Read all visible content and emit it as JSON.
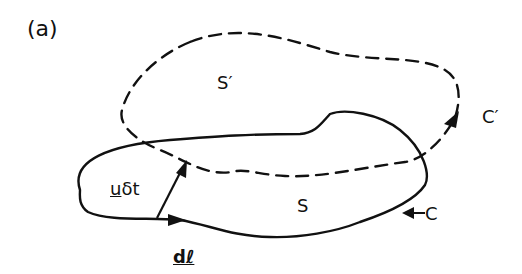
{
  "figure": {
    "panel_label": "(a)",
    "labels": {
      "surface_displaced": "S′",
      "contour_displaced": "C′",
      "surface": "S",
      "contour": "C",
      "velocity_displacement": "uδt",
      "line_element": "dℓ"
    },
    "elements": {
      "contour_C": {
        "style": "solid",
        "color": "#111111"
      },
      "contour_C_prime": {
        "style": "dashed",
        "color": "#111111"
      },
      "displacement_arrow": {
        "label": "uδt"
      },
      "line_element_arrow": {
        "label": "dℓ"
      }
    }
  }
}
